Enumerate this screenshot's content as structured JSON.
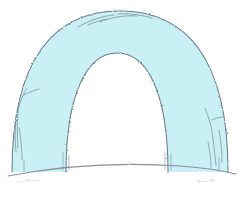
{
  "canvas": {
    "width": 244,
    "height": 207,
    "background_color": "#ffffff",
    "title": "Hand-drawn arch sketch"
  },
  "drawing": {
    "subject": "arch",
    "description": "Hand-drawn sketch of a thick rounded arch / archway standing on a gently curved ground line",
    "fill_color": "#c8f0f5",
    "outline_color": "#6b7b88",
    "ground_line_color": "#8a8f96",
    "outer_arch": {
      "left_base_x": 12,
      "right_base_x": 228,
      "apex_y": 11,
      "base_y": 170
    },
    "inner_arch": {
      "left_base_x": 66,
      "right_base_x": 168,
      "apex_y": 53,
      "base_y": 170,
      "fill_color": "#ffffff"
    },
    "ground": {
      "left_x": 8,
      "right_x": 236,
      "left_y": 176,
      "right_y": 174,
      "mid_y": 163
    }
  },
  "annotations": {
    "left": {
      "name": "left-annotation",
      "text": "⸺∿⸺",
      "legible": false,
      "note": "illegible handwritten scribble"
    },
    "right": {
      "name": "right-annotation",
      "text": "∿⸺∿",
      "legible": false,
      "note": "illegible handwritten scribble"
    }
  }
}
